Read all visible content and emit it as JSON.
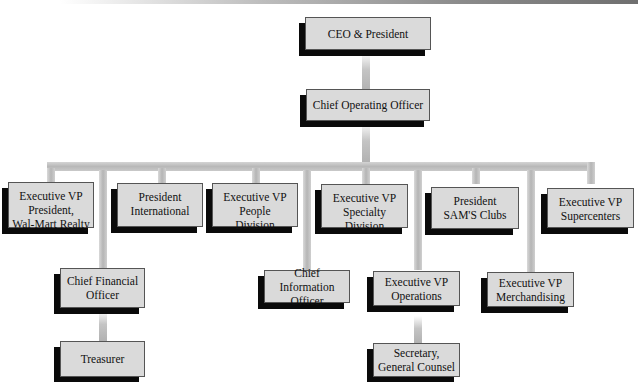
{
  "chart_title": "",
  "nodes": {
    "ceo": "CEO & President",
    "coo": "Chief Operating Officer",
    "realty": "Executive VP\nPresident,\nWal-Mart Realty",
    "international": "President\nInternational",
    "people": "Executive VP\nPeople\nDivision",
    "specialty": "Executive VP\nSpecialty\nDivision",
    "sams": "President\nSAM'S Clubs",
    "supercenters": "Executive VP\nSupercenters",
    "cfo": "Chief Financial\nOfficer",
    "treasurer": "Treasurer",
    "cio": "Chief\nInformation Officer",
    "operations": "Executive VP\nOperations",
    "merchandising": "Executive VP\nMerchandising",
    "secretary": "Secretary,\nGeneral Counsel"
  },
  "hierarchy": {
    "CEO & President": [
      "Chief Operating Officer"
    ],
    "Chief Operating Officer": [
      "Executive VP President, Wal-Mart Realty",
      "President International",
      "Executive VP People Division",
      "Executive VP Specialty Division",
      "President SAM'S Clubs",
      "Executive VP Supercenters",
      "Chief Financial Officer",
      "Chief Information Officer",
      "Executive VP Operations",
      "Executive VP Merchandising"
    ],
    "Chief Financial Officer": [
      "Treasurer"
    ],
    "Executive VP Operations": [
      "Secretary, General Counsel"
    ]
  },
  "colors": {
    "box_fill": "#dadada",
    "box_shadow": "#0a0a0a",
    "connector": "#b8b8b8",
    "background": "#ffffff"
  }
}
